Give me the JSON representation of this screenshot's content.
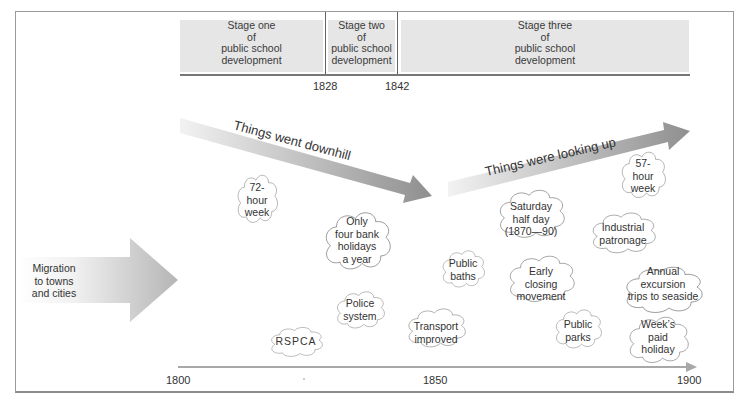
{
  "stages": [
    {
      "label": "Stage one\nof\npublic school\ndevelopment",
      "lines": [
        "Stage one",
        "of",
        "public school",
        "development"
      ]
    },
    {
      "label": "Stage two\nof\npublic school\ndevelopment",
      "lines": [
        "Stage two",
        "of",
        "public school",
        "development"
      ]
    },
    {
      "label": "Stage three\nof\npublic school\ndevelopment",
      "lines": [
        "Stage three",
        "of",
        "public school",
        "development"
      ]
    }
  ],
  "stage_years": [
    "1828",
    "1842"
  ],
  "arrows": {
    "downhill": "Things went downhill",
    "looking_up": "Things were looking up",
    "migration": [
      "Migration",
      "to towns",
      "and cities"
    ]
  },
  "clouds": [
    {
      "id": "72-hour-week",
      "lines": [
        "72-",
        "hour",
        "week"
      ]
    },
    {
      "id": "bank-holidays",
      "lines": [
        "Only",
        "four bank",
        "holidays",
        "a year"
      ]
    },
    {
      "id": "police-system",
      "lines": [
        "Police",
        "system"
      ]
    },
    {
      "id": "rspca",
      "lines": [
        "RSPCA"
      ]
    },
    {
      "id": "transport-improved",
      "lines": [
        "Transport",
        "improved"
      ]
    },
    {
      "id": "public-baths",
      "lines": [
        "Public",
        "baths"
      ]
    },
    {
      "id": "saturday-half-day",
      "lines": [
        "Saturday",
        "half day",
        "(1870—90)"
      ]
    },
    {
      "id": "early-closing",
      "lines": [
        "Early",
        "closing",
        "movement"
      ]
    },
    {
      "id": "public-parks",
      "lines": [
        "Public",
        "parks"
      ]
    },
    {
      "id": "57-hour-week",
      "lines": [
        "57-",
        "hour",
        "week"
      ]
    },
    {
      "id": "industrial-patronage",
      "lines": [
        "Industrial",
        "patronage"
      ]
    },
    {
      "id": "annual-excursion",
      "lines": [
        "Annual",
        "excursion",
        "trips to seaside"
      ]
    },
    {
      "id": "weeks-paid-holiday",
      "lines": [
        "Week’s",
        "paid",
        "holiday"
      ]
    }
  ],
  "timeline": {
    "ticks": [
      "1800",
      "1850",
      "1900"
    ]
  }
}
